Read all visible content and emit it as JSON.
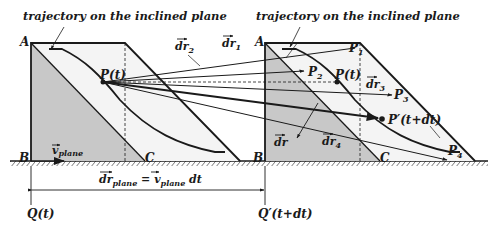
{
  "diagram": {
    "title_left": "trajectory on the inclined plane",
    "title_right": "trajectory on the inclined plane",
    "left_prism": {
      "vertex_a": "A",
      "vertex_b": "B",
      "vertex_c": "C",
      "point": "P(t)",
      "velocity_label": "v",
      "velocity_sub": "plane"
    },
    "right_prism": {
      "vertex_a": "A",
      "vertex_b": "B",
      "vertex_c": "C",
      "point": "P(t)",
      "point_prime": "P′(t+dt)",
      "p1": "P",
      "p1_sub": "1",
      "p2": "P",
      "p2_sub": "2",
      "p3": "P",
      "p3_sub": "3",
      "p4": "P",
      "p4_sub": "4"
    },
    "vectors": {
      "dr1": "dr",
      "dr1_sub": "1",
      "dr2": "dr",
      "dr2_sub": "2",
      "dr3": "dr",
      "dr3_sub": "3",
      "dr4": "dr",
      "dr4_sub": "4",
      "dr": "dr"
    },
    "equation": {
      "lhs": "dr",
      "lhs_sub": "plane",
      "eq": " = ",
      "rhs": "v",
      "rhs_sub": "plane",
      "rhs_tail": " dt"
    },
    "frames": {
      "left": "Q(t)",
      "right": "Q′(t+dt)"
    },
    "colors": {
      "ink": "#1a1a1a",
      "shade": "#c8c8c8",
      "plane_fill": "#f4f4f4",
      "background": "#ffffff"
    }
  }
}
